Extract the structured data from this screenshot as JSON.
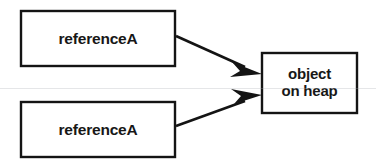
{
  "diagram": {
    "background_color": "#ffffff",
    "stroke_color": "#141414",
    "fill_color": "#ffffff",
    "nodes": [
      {
        "id": "reference-a-top",
        "label": "referenceA",
        "x": 21,
        "y": 11,
        "width": 154,
        "height": 55
      },
      {
        "id": "reference-a-bottom",
        "label": "referenceA",
        "x": 21,
        "y": 102,
        "width": 154,
        "height": 55
      },
      {
        "id": "object-on-heap",
        "label": "object\non heap",
        "line1": "object",
        "line2": "on heap",
        "x": 262,
        "y": 53,
        "width": 95,
        "height": 60
      }
    ],
    "edges": [
      {
        "id": "edge-top",
        "from": "reference-a-top",
        "to": "object-on-heap",
        "from_point": [
          176,
          36
        ],
        "to_point": [
          262,
          74
        ],
        "arrowhead": "solid-barbed"
      },
      {
        "id": "edge-bottom",
        "from": "reference-a-bottom",
        "to": "object-on-heap",
        "from_point": [
          176,
          126
        ],
        "to_point": [
          262,
          95
        ],
        "arrowhead": "solid-barbed"
      }
    ]
  }
}
